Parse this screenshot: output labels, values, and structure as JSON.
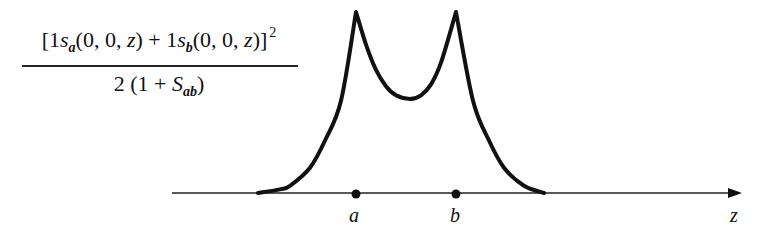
{
  "formula": {
    "open_bracket": "[",
    "coef_a": "1",
    "orbital_symbol_a": "s",
    "orbital_sub_a": "a",
    "args_a_open": "(0, 0, ",
    "var_a": "z",
    "args_a_close": ")",
    "plus": " + ",
    "coef_b": "1",
    "orbital_symbol_b": "s",
    "orbital_sub_b": "b",
    "args_b_open": "(0, 0, ",
    "var_b": "z",
    "args_b_close": ")",
    "close_bracket": "]",
    "exponent": "2",
    "den_prefix": "2 (1 + ",
    "overlap_symbol": "S",
    "overlap_sub": "ab",
    "den_suffix": ")"
  },
  "axis": {
    "label": "z",
    "point_a_label": "a",
    "point_b_label": "b"
  },
  "colors": {
    "ink": "#111111",
    "background": "#ffffff"
  },
  "chart_data": {
    "type": "line",
    "xlabel": "z",
    "ylabel": "[1s_a(0,0,z) + 1s_b(0,0,z)]^2 / 2(1 + S_ab)",
    "annotations": [
      {
        "label": "a",
        "z": 0.0,
        "marker": "dot-on-axis"
      },
      {
        "label": "b",
        "z": 1.0,
        "marker": "dot-on-axis"
      }
    ],
    "x_units": "internuclear distance a→b normalized to 1",
    "y_units": "normalized density (peak = 1)",
    "grid": false,
    "legend": "none",
    "xlim": [
      -1.85,
      3.85
    ],
    "ylim": [
      0,
      1.05
    ],
    "series": [
      {
        "name": "bonding electron density along z",
        "x": [
          -0.98,
          -0.76,
          -0.66,
          -0.46,
          -0.31,
          -0.15,
          0.0,
          0.1,
          0.2,
          0.3,
          0.4,
          0.54,
          0.65,
          0.75,
          0.85,
          1.0,
          1.17,
          1.33,
          1.48,
          1.68,
          1.88
        ],
        "y": [
          0.0,
          0.02,
          0.04,
          0.14,
          0.29,
          0.51,
          1.0,
          0.82,
          0.68,
          0.59,
          0.54,
          0.52,
          0.54,
          0.6,
          0.72,
          1.0,
          0.51,
          0.29,
          0.14,
          0.04,
          0.0
        ]
      }
    ]
  }
}
